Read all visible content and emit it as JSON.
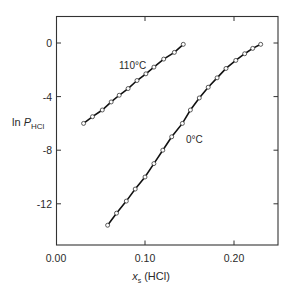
{
  "chart_data": {
    "type": "line",
    "title": "",
    "xlabel": "x_s (HCl)",
    "ylabel": "ln P_HCl",
    "xlim": [
      0.0,
      0.25
    ],
    "ylim": [
      -15.0,
      2.0
    ],
    "xticks": [
      0.0,
      0.1,
      0.2
    ],
    "xtick_labels": [
      "0.00",
      "0.10",
      "0.20"
    ],
    "yticks": [
      0,
      -4,
      -8,
      -12
    ],
    "ytick_labels": [
      "0",
      "-4",
      "-8",
      "-12"
    ],
    "grid": false,
    "legend": null,
    "series": [
      {
        "name": "110°C",
        "label": "110°C",
        "marker": "open-circle",
        "x": [
          0.031,
          0.041,
          0.052,
          0.062,
          0.071,
          0.081,
          0.091,
          0.101,
          0.11,
          0.121,
          0.133,
          0.143
        ],
        "y": [
          -6.0,
          -5.5,
          -5.0,
          -4.4,
          -3.9,
          -3.4,
          -2.8,
          -2.3,
          -1.8,
          -1.2,
          -0.7,
          -0.1
        ]
      },
      {
        "name": "0°C",
        "label": "0°C",
        "marker": "open-circle",
        "x": [
          0.058,
          0.068,
          0.079,
          0.089,
          0.1,
          0.11,
          0.12,
          0.13,
          0.142,
          0.151,
          0.161,
          0.171,
          0.181,
          0.191,
          0.202,
          0.212,
          0.221,
          0.23
        ],
        "y": [
          -13.6,
          -12.7,
          -11.8,
          -10.9,
          -10.0,
          -9.0,
          -8.0,
          -7.0,
          -6.0,
          -5.0,
          -4.1,
          -3.3,
          -2.6,
          -1.9,
          -1.3,
          -0.8,
          -0.4,
          -0.1
        ]
      }
    ],
    "annotations": [
      {
        "text": "110°C",
        "x": 0.095,
        "y": -1.5
      },
      {
        "text": "0°C",
        "x": 0.141,
        "y": -7.4
      }
    ]
  },
  "labels": {
    "ylabel_main": "ln ",
    "ylabel_var": "P",
    "ylabel_sub": "HCl",
    "xlabel_var": "x",
    "xlabel_sub": "s",
    "xlabel_rest": " (HCl)",
    "series_110": "110°C",
    "series_0": "0°C",
    "xtick_0": "0.00",
    "xtick_1": "0.10",
    "xtick_2": "0.20",
    "ytick_0": "0",
    "ytick_1": "-4",
    "ytick_2": "-8",
    "ytick_3": "-12"
  }
}
